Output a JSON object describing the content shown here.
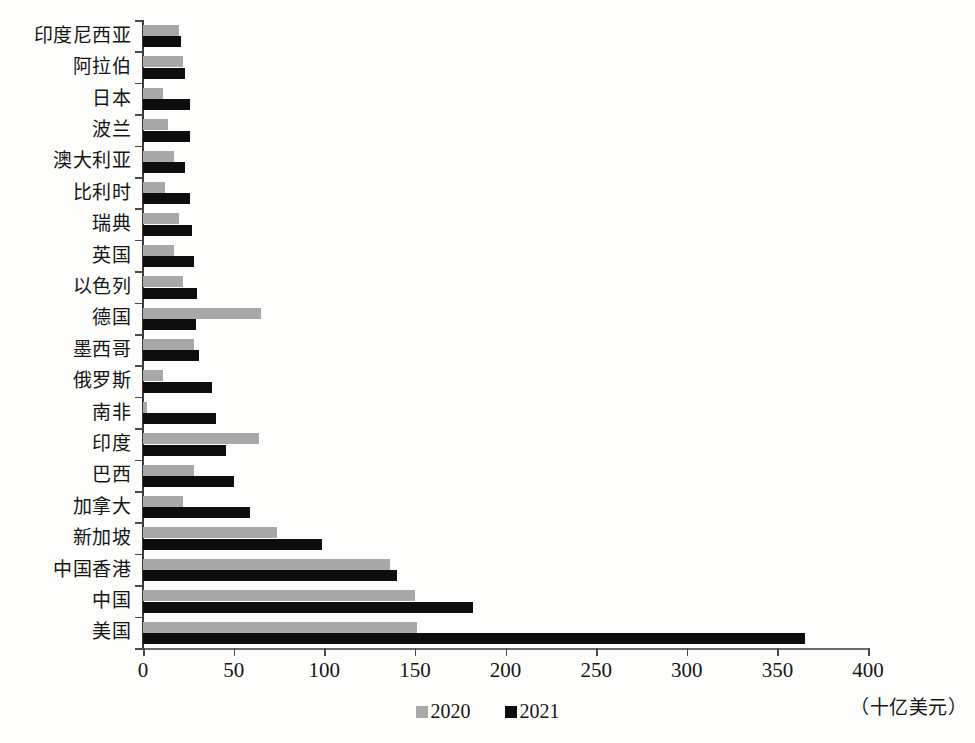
{
  "chart_data": {
    "type": "bar",
    "orientation": "horizontal",
    "title": "",
    "xlabel": "（十亿美元）",
    "ylabel": "",
    "xlim": [
      0,
      400
    ],
    "xticks": [
      0,
      50,
      100,
      150,
      200,
      250,
      300,
      350,
      400
    ],
    "grid": false,
    "legend_position": "bottom-center",
    "categories": [
      "印度尼西亚",
      "阿拉伯",
      "日本",
      "波兰",
      "澳大利亚",
      "比利时",
      "瑞典",
      "英国",
      "以色列",
      "德国",
      "墨西哥",
      "俄罗斯",
      "南非",
      "印度",
      "巴西",
      "加拿大",
      "新加坡",
      "中国香港",
      "中国",
      "美国"
    ],
    "series": [
      {
        "name": "2020",
        "color": "#a8a8a8",
        "values": [
          20,
          22,
          11,
          14,
          17,
          12,
          20,
          17,
          22,
          65,
          28,
          11,
          2,
          64,
          28,
          22,
          74,
          136,
          150,
          151
        ]
      },
      {
        "name": "2021",
        "color": "#0d0d0d",
        "values": [
          21,
          23,
          26,
          26,
          23,
          26,
          27,
          28,
          30,
          29,
          31,
          38,
          40,
          46,
          50,
          59,
          99,
          140,
          182,
          365
        ]
      }
    ]
  },
  "legend": {
    "items": [
      {
        "label": "2020",
        "swatch": "gray-square-swatch"
      },
      {
        "label": "2021",
        "swatch": "black-square-swatch"
      }
    ]
  },
  "axis": {
    "unit_caption": "（十亿美元）"
  }
}
